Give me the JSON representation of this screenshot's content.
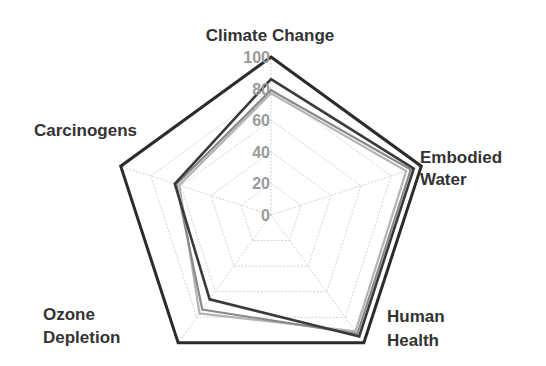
{
  "chart_data": {
    "type": "radar",
    "title": "",
    "categories": [
      "Climate Change",
      "Embodied Water",
      "Human Health",
      "Ozone Depletion",
      "Carcinogens"
    ],
    "category_labels": [
      [
        "Climate Change"
      ],
      [
        "Embodied",
        "Water"
      ],
      [
        "Human",
        "Health"
      ],
      [
        "Ozone",
        "Depletion"
      ],
      [
        "Carcinogens"
      ]
    ],
    "radial_ticks": [
      0,
      20,
      40,
      60,
      80,
      100
    ],
    "rlim": [
      0,
      100
    ],
    "grid": true,
    "legend": "none",
    "series": [
      {
        "name": "Series 1",
        "color": "#2b2b2b",
        "width": 3,
        "values": [
          100,
          100,
          100,
          100,
          100
        ]
      },
      {
        "name": "Series 2",
        "color": "#3a3a3a",
        "width": 2.6,
        "values": [
          86,
          95,
          95,
          66,
          64
        ]
      },
      {
        "name": "Series 3",
        "color": "#8a8a8a",
        "width": 2.2,
        "values": [
          79,
          93,
          93,
          74,
          63
        ]
      },
      {
        "name": "Series 4",
        "color": "#b4b4b4",
        "width": 2.2,
        "values": [
          77,
          90,
          91,
          77,
          61
        ]
      }
    ]
  }
}
